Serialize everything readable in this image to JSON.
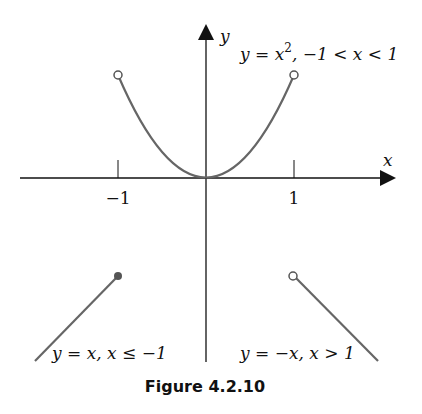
{
  "figure": {
    "caption": "Figure 4.2.10",
    "axes": {
      "x_label": "x",
      "y_label": "y",
      "ticks": [
        {
          "value": -1,
          "label": "−1"
        },
        {
          "value": 1,
          "label": "1"
        }
      ]
    },
    "pieces": [
      {
        "label": "y = x², −1 < x < 1",
        "endpoints": "open circles at (−1,1) and (1,1)"
      },
      {
        "label": "y = x, x ≤ −1",
        "endpoints": "closed dot at (−1,−1)"
      },
      {
        "label": "y = −x, x > 1",
        "endpoints": "open circle at (1,−1)"
      }
    ],
    "labels": {
      "parabola_y": "y",
      "parabola_eq": " = x",
      "parabola_exp": "2",
      "parabola_domain": ", −1 < x < 1",
      "left_line": "y = x, x ≤ −1",
      "right_line": "y = −x, x > 1"
    },
    "colors": {
      "axis": "#111111",
      "curve": "#666666"
    }
  }
}
